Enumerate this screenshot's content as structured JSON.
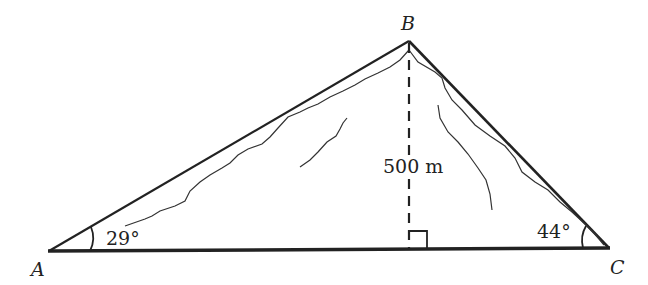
{
  "diagram": {
    "type": "right-triangle-altitude",
    "vertices": {
      "A": {
        "label": "A",
        "x": 50,
        "y": 252
      },
      "B": {
        "label": "B",
        "x": 409,
        "y": 41
      },
      "C": {
        "label": "C",
        "x": 608,
        "y": 248
      }
    },
    "angles": {
      "A": {
        "label": "29°",
        "value": 29
      },
      "C": {
        "label": "44°",
        "value": 44
      }
    },
    "height": {
      "label": "500 m",
      "value": 500,
      "unit": "m"
    },
    "right_angle_marker": true,
    "colors": {
      "line": "#222222",
      "background": "#ffffff"
    }
  }
}
